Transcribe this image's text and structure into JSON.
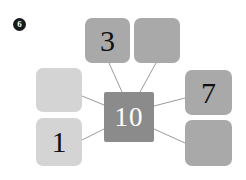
{
  "question": {
    "number": "6",
    "badge_name": "question-number-badge"
  },
  "colors": {
    "page_background": "#ffffff",
    "outer_box_dark": "#a9a9a9",
    "outer_box_light": "#d4d4d4",
    "center_box": "#8b8b8b",
    "connector_line": "#9a9a9a",
    "dark_text": "#111111",
    "light_text": "#ffffff",
    "badge_background": "#1a1a1a"
  },
  "diagram": {
    "type": "number-bond-hub-and-spoke",
    "center": {
      "value": "10",
      "filled": true
    },
    "nodes": [
      {
        "id": "top-left",
        "value": "3",
        "filled": true,
        "shade": "dark"
      },
      {
        "id": "top-right",
        "value": "",
        "filled": false,
        "shade": "dark"
      },
      {
        "id": "left-top",
        "value": "",
        "filled": false,
        "shade": "light"
      },
      {
        "id": "left-bottom",
        "value": "1",
        "filled": true,
        "shade": "light"
      },
      {
        "id": "right-top",
        "value": "7",
        "filled": true,
        "shade": "dark"
      },
      {
        "id": "right-bottom",
        "value": "",
        "filled": false,
        "shade": "dark"
      }
    ],
    "connectors": [
      {
        "from": "top-left",
        "to": "center"
      },
      {
        "from": "top-right",
        "to": "center"
      },
      {
        "from": "left-top",
        "to": "center"
      },
      {
        "from": "left-bottom",
        "to": "center"
      },
      {
        "from": "right-top",
        "to": "center"
      },
      {
        "from": "right-bottom",
        "to": "center"
      }
    ]
  }
}
